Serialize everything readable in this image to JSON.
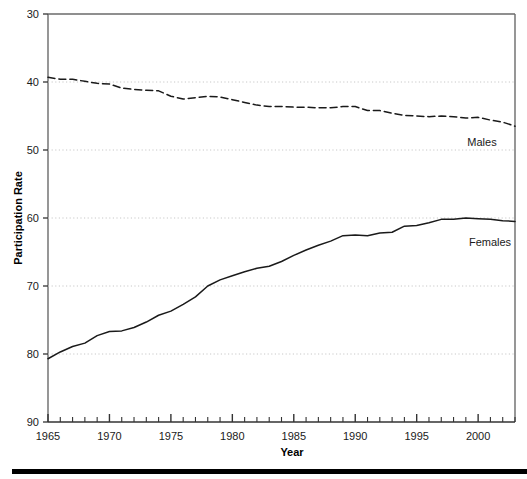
{
  "chart_data": {
    "type": "line",
    "title": "",
    "xlabel": "Year",
    "ylabel": "Participation Rate",
    "xlim": [
      1965,
      2003
    ],
    "ylim": [
      30,
      90
    ],
    "yticks": [
      30,
      40,
      50,
      60,
      70,
      80,
      90
    ],
    "xticks_major": [
      1965,
      1970,
      1975,
      1980,
      1985,
      1990,
      1995,
      2000
    ],
    "xticks_minor_step": 1,
    "grid": "horizontal-dotted",
    "legend_position": "inline-right",
    "x": [
      1965,
      1966,
      1967,
      1968,
      1969,
      1970,
      1971,
      1972,
      1973,
      1974,
      1975,
      1976,
      1977,
      1978,
      1979,
      1980,
      1981,
      1982,
      1983,
      1984,
      1985,
      1986,
      1987,
      1988,
      1989,
      1990,
      1991,
      1992,
      1993,
      1994,
      1995,
      1996,
      1997,
      1998,
      1999,
      2000,
      2001,
      2002,
      2003
    ],
    "series": [
      {
        "name": "Males",
        "style": "dashed",
        "color": "#1a1a1a",
        "values": [
          80.7,
          80.4,
          80.4,
          80.1,
          79.8,
          79.7,
          79.1,
          78.9,
          78.8,
          78.7,
          77.9,
          77.5,
          77.7,
          77.9,
          77.8,
          77.4,
          77.0,
          76.6,
          76.4,
          76.4,
          76.3,
          76.3,
          76.2,
          76.2,
          76.4,
          76.4,
          75.8,
          75.8,
          75.4,
          75.1,
          75.0,
          74.9,
          75.0,
          74.9,
          74.7,
          74.8,
          74.4,
          74.1,
          73.5
        ],
        "endpoint_label": "Males"
      },
      {
        "name": "Females",
        "style": "solid",
        "color": "#1a1a1a",
        "values": [
          39.3,
          40.3,
          41.1,
          41.6,
          42.7,
          43.3,
          43.4,
          43.9,
          44.7,
          45.7,
          46.3,
          47.3,
          48.4,
          50.0,
          50.9,
          51.5,
          52.1,
          52.6,
          52.9,
          53.6,
          54.5,
          55.3,
          56.0,
          56.6,
          57.4,
          57.5,
          57.4,
          57.8,
          57.9,
          58.8,
          58.9,
          59.3,
          59.8,
          59.8,
          60.0,
          59.9,
          59.8,
          59.6,
          59.5
        ],
        "endpoint_label": "Females"
      }
    ]
  },
  "axes": {
    "y_title": "Participation Rate",
    "x_title": "Year",
    "y_tick_labels": [
      "90",
      "80",
      "70",
      "60",
      "50",
      "40",
      "30"
    ],
    "x_tick_labels": [
      "1965",
      "1970",
      "1975",
      "1980",
      "1985",
      "1990",
      "1995",
      "2000"
    ]
  },
  "annotations": {
    "males_label": "Males",
    "females_label": "Females"
  },
  "colors": {
    "line": "#1a1a1a",
    "frame": "#555555",
    "grid": "#c8c8c8",
    "rule": "#000000",
    "background": "#ffffff"
  }
}
